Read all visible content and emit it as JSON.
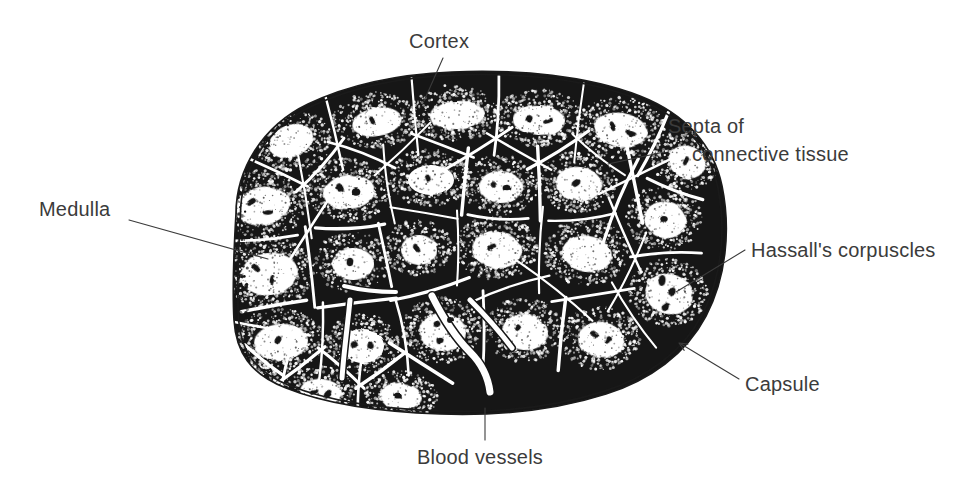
{
  "figure": {
    "view": "transverse section, low magnification",
    "background_color": "#ffffff",
    "ink_color": "#161616",
    "label_color": "#3b3b3b",
    "width": 969,
    "height": 498
  },
  "labels": [
    {
      "id": "cortex",
      "text": "Cortex",
      "text_x": 409,
      "text_y": 48,
      "anchor": "start",
      "leader": "M 443 58 L 424 101",
      "pointer": "none",
      "describes": "dark-staining outer zone of each lobule, dense with thymocytes"
    },
    {
      "id": "septa-of-connective-tissue",
      "text_line_1": "Septa of",
      "text_line_2": "connective tissue",
      "text_x": 668,
      "text_y": 133,
      "text2_x": 692,
      "text2_y": 161,
      "anchor": "start",
      "leader": "M 664 152 L 608 164",
      "pointer": "none",
      "describes": "pale connective-tissue partitions dividing the gland into lobules"
    },
    {
      "id": "hassalls-corpuscles",
      "text": "Hassall's corpuscles",
      "text_x": 751,
      "text_y": 257,
      "anchor": "start",
      "leader": "M 745 250 L 676 292",
      "pointer": "none",
      "describes": "concentric epithelial whorls found in the medulla"
    },
    {
      "id": "capsule",
      "text": "Capsule",
      "text_x": 745,
      "text_y": 391,
      "anchor": "start",
      "leader": "M 739 379 L 681 344",
      "pointer": "arrow",
      "arrow_x": 679,
      "arrow_y": 343,
      "arrow_angle": 211,
      "describes": "thin fibrous outer covering of the gland"
    },
    {
      "id": "medulla",
      "text": "Medulla",
      "text_x": 39,
      "text_y": 216,
      "anchor": "start",
      "leader": "M 129 220 L 268 259",
      "pointer": "none",
      "describes": "pale-staining inner zone of each lobule"
    },
    {
      "id": "blood-vessels",
      "text": "Blood vessels",
      "text_x": 417,
      "text_y": 464,
      "anchor": "start",
      "leader": "M 485 440 L 485 408",
      "pointer": "none",
      "describes": "vessels running within the interlobular septa"
    }
  ],
  "specimen": {
    "outline_path": "M 236 214 C 236 170, 262 126, 308 104 C 352 83, 404 74, 452 72 C 520 69, 588 76, 640 96 C 686 114, 714 146, 722 186 C 731 230, 726 278, 706 316 C 686 354, 650 380, 606 394 C 556 410, 498 416, 440 414 C 382 412, 326 404, 286 388 C 250 374, 236 352, 234 320 C 232 284, 234 248, 236 214 Z",
    "capsule_inner_offset": 5,
    "ragged_left_edge": true,
    "lobule_count": 26,
    "lobules": [
      {
        "cx": 292,
        "cy": 140,
        "rx": 40,
        "ry": 31,
        "rot": -22,
        "mx": 291,
        "my": 141,
        "mrx": 23,
        "mry": 16,
        "corpuscles": []
      },
      {
        "cx": 375,
        "cy": 120,
        "rx": 42,
        "ry": 28,
        "rot": -10,
        "mx": 377,
        "my": 122,
        "mrx": 25,
        "mry": 14,
        "corpuscles": [
          [
            372,
            120
          ]
        ]
      },
      {
        "cx": 455,
        "cy": 113,
        "rx": 45,
        "ry": 28,
        "rot": -4,
        "mx": 457,
        "my": 115,
        "mrx": 27,
        "mry": 14,
        "corpuscles": []
      },
      {
        "cx": 538,
        "cy": 118,
        "rx": 44,
        "ry": 29,
        "rot": 4,
        "mx": 539,
        "my": 120,
        "mrx": 26,
        "mry": 15,
        "corpuscles": [
          [
            529,
            119
          ],
          [
            548,
            121
          ]
        ]
      },
      {
        "cx": 620,
        "cy": 128,
        "rx": 45,
        "ry": 31,
        "rot": 10,
        "mx": 621,
        "my": 130,
        "mrx": 27,
        "mry": 17,
        "corpuscles": [
          [
            613,
            126
          ],
          [
            631,
            133
          ]
        ]
      },
      {
        "cx": 686,
        "cy": 160,
        "rx": 34,
        "ry": 30,
        "rot": 22,
        "mx": 687,
        "my": 162,
        "mrx": 19,
        "mry": 16,
        "corpuscles": [
          [
            686,
            161
          ]
        ]
      },
      {
        "cx": 262,
        "cy": 204,
        "rx": 44,
        "ry": 34,
        "rot": -12,
        "mx": 263,
        "my": 206,
        "mrx": 27,
        "mry": 19,
        "corpuscles": [
          [
            252,
            202
          ],
          [
            268,
            212
          ]
        ]
      },
      {
        "cx": 348,
        "cy": 190,
        "rx": 44,
        "ry": 32,
        "rot": -5,
        "mx": 349,
        "my": 192,
        "mrx": 26,
        "mry": 17,
        "corpuscles": [
          [
            340,
            188
          ],
          [
            356,
            192
          ]
        ]
      },
      {
        "cx": 430,
        "cy": 178,
        "rx": 40,
        "ry": 29,
        "rot": 0,
        "mx": 431,
        "my": 180,
        "mrx": 23,
        "mry": 15,
        "corpuscles": [
          [
            428,
            178
          ]
        ]
      },
      {
        "cx": 500,
        "cy": 185,
        "rx": 38,
        "ry": 30,
        "rot": 5,
        "mx": 501,
        "my": 187,
        "mrx": 22,
        "mry": 16,
        "corpuscles": [
          [
            493,
            184
          ],
          [
            507,
            188
          ]
        ]
      },
      {
        "cx": 578,
        "cy": 182,
        "rx": 40,
        "ry": 31,
        "rot": 8,
        "mx": 579,
        "my": 184,
        "mrx": 23,
        "mry": 17,
        "corpuscles": [
          [
            576,
            183
          ]
        ]
      },
      {
        "cx": 664,
        "cy": 218,
        "rx": 38,
        "ry": 33,
        "rot": 16,
        "mx": 665,
        "my": 220,
        "mrx": 21,
        "mry": 18,
        "corpuscles": [
          [
            664,
            219
          ]
        ]
      },
      {
        "cx": 268,
        "cy": 272,
        "rx": 46,
        "ry": 36,
        "rot": -8,
        "mx": 269,
        "my": 274,
        "mrx": 29,
        "mry": 21,
        "corpuscles": [
          [
            256,
            268
          ],
          [
            272,
            280
          ]
        ]
      },
      {
        "cx": 352,
        "cy": 262,
        "rx": 38,
        "ry": 30,
        "rot": -2,
        "mx": 353,
        "my": 264,
        "mrx": 21,
        "mry": 16,
        "corpuscles": [
          [
            350,
            262
          ]
        ]
      },
      {
        "cx": 418,
        "cy": 248,
        "rx": 34,
        "ry": 28,
        "rot": 2,
        "mx": 419,
        "my": 250,
        "mrx": 18,
        "mry": 15,
        "corpuscles": [
          [
            417,
            248
          ]
        ]
      },
      {
        "cx": 496,
        "cy": 248,
        "rx": 42,
        "ry": 32,
        "rot": 6,
        "mx": 497,
        "my": 250,
        "mrx": 25,
        "mry": 18,
        "corpuscles": [
          [
            492,
            247
          ]
        ]
      },
      {
        "cx": 586,
        "cy": 252,
        "rx": 42,
        "ry": 33,
        "rot": 8,
        "mx": 587,
        "my": 254,
        "mrx": 25,
        "mry": 18,
        "corpuscles": []
      },
      {
        "cx": 668,
        "cy": 292,
        "rx": 40,
        "ry": 34,
        "rot": 14,
        "mx": 669,
        "my": 294,
        "mrx": 24,
        "mry": 20,
        "corpuscles": [
          [
            662,
            281
          ],
          [
            672,
            292
          ],
          [
            666,
            307
          ]
        ]
      },
      {
        "cx": 280,
        "cy": 340,
        "rx": 44,
        "ry": 32,
        "rot": -4,
        "mx": 281,
        "my": 342,
        "mrx": 27,
        "mry": 18,
        "corpuscles": [
          [
            278,
            340
          ]
        ]
      },
      {
        "cx": 362,
        "cy": 344,
        "rx": 38,
        "ry": 30,
        "rot": 0,
        "mx": 363,
        "my": 346,
        "mrx": 21,
        "mry": 17,
        "corpuscles": [
          [
            354,
            344
          ],
          [
            370,
            346
          ]
        ]
      },
      {
        "cx": 442,
        "cy": 330,
        "rx": 40,
        "ry": 33,
        "rot": 4,
        "mx": 443,
        "my": 332,
        "mrx": 23,
        "mry": 19,
        "corpuscles": [
          [
            437,
            324
          ],
          [
            450,
            320
          ],
          [
            440,
            340
          ]
        ]
      },
      {
        "cx": 524,
        "cy": 330,
        "rx": 40,
        "ry": 32,
        "rot": 6,
        "mx": 525,
        "my": 332,
        "mrx": 23,
        "mry": 18,
        "corpuscles": [
          [
            518,
            328
          ]
        ]
      },
      {
        "cx": 600,
        "cy": 338,
        "rx": 40,
        "ry": 32,
        "rot": 8,
        "mx": 601,
        "my": 340,
        "mrx": 23,
        "mry": 18,
        "corpuscles": [
          [
            594,
            334
          ],
          [
            608,
            340
          ]
        ]
      },
      {
        "cx": 320,
        "cy": 392,
        "rx": 38,
        "ry": 26,
        "rot": 4,
        "mx": 321,
        "my": 392,
        "mrx": 21,
        "mry": 13,
        "corpuscles": [
          [
            314,
            392
          ],
          [
            328,
            394
          ]
        ]
      },
      {
        "cx": 400,
        "cy": 396,
        "rx": 38,
        "ry": 26,
        "rot": 6,
        "mx": 401,
        "my": 396,
        "mrx": 21,
        "mry": 13,
        "corpuscles": [
          [
            398,
            396
          ]
        ]
      },
      {
        "cx": 248,
        "cy": 380,
        "rx": 30,
        "ry": 24,
        "rot": -6,
        "mx": 249,
        "my": 380,
        "mrx": 15,
        "mry": 12,
        "corpuscles": []
      }
    ],
    "vessels": [
      {
        "path": "M 432 296 C 440 312, 452 334, 470 352 C 480 362, 488 376, 490 392",
        "width": 7
      },
      {
        "path": "M 350 300 C 348 322, 344 350, 342 378",
        "width": 5
      },
      {
        "path": "M 470 300 C 486 316, 500 332, 512 348",
        "width": 5
      },
      {
        "path": "M 344 286 C 360 290, 378 292, 396 292",
        "width": 4
      }
    ],
    "stipple_seed": 20250214,
    "stipple_density": 0.55
  }
}
